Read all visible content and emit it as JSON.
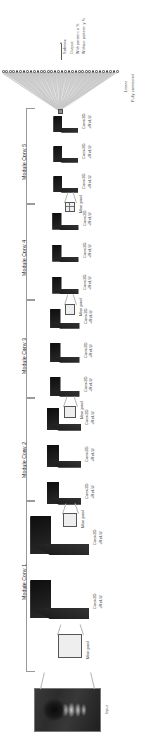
{
  "figure": {
    "type": "cnn-architecture-diagram",
    "orientation": "rotated-90-ccw",
    "input": {
      "label": "Input"
    },
    "output": {
      "softmax_label": "Softmax",
      "output_label": "Output:",
      "class_with": "With pattern: x %",
      "class_without": "Without pattern: y %"
    },
    "dense": {
      "linear_label": "Linear",
      "fully_connected_label": "Fully connected",
      "neuron_count": 34
    },
    "layer_labels": {
      "conv": "Conv2D",
      "relu": "+ReLU",
      "maxpool": "Max pool"
    },
    "modules": [
      {
        "name": "Module Conv 1",
        "conv_count": 2,
        "layers": [
          {
            "kind": "conv",
            "line1": "Conv2D",
            "line2": "+ReLU"
          },
          {
            "kind": "conv",
            "line1": "Conv2D",
            "line2": "+ReLU"
          },
          {
            "kind": "pool",
            "line1": "Max pool",
            "line2": ""
          }
        ]
      },
      {
        "name": "Module Conv 2",
        "conv_count": 3,
        "layers": [
          {
            "kind": "conv",
            "line1": "Conv2D",
            "line2": "+ReLU"
          },
          {
            "kind": "conv",
            "line1": "Conv2D",
            "line2": "+ReLU"
          },
          {
            "kind": "conv",
            "line1": "Conv2D",
            "line2": "+ReLU"
          },
          {
            "kind": "pool",
            "line1": "Max pool",
            "line2": ""
          }
        ]
      },
      {
        "name": "Module Conv 3",
        "conv_count": 3,
        "layers": [
          {
            "kind": "conv",
            "line1": "Conv2D",
            "line2": "+ReLU"
          },
          {
            "kind": "conv",
            "line1": "Conv2D",
            "line2": "+ReLU"
          },
          {
            "kind": "conv",
            "line1": "Conv2D",
            "line2": "+ReLU"
          },
          {
            "kind": "pool",
            "line1": "Max pool",
            "line2": ""
          }
        ]
      },
      {
        "name": "Module Conv 4",
        "conv_count": 3,
        "layers": [
          {
            "kind": "conv",
            "line1": "Conv2D",
            "line2": "+ReLU"
          },
          {
            "kind": "conv",
            "line1": "Conv2D",
            "line2": "+ReLU"
          },
          {
            "kind": "conv",
            "line1": "Conv2D",
            "line2": "+ReLU"
          },
          {
            "kind": "pool",
            "line1": "Max pool",
            "line2": ""
          }
        ]
      },
      {
        "name": "Module Conv 5",
        "conv_count": 3,
        "layers": [
          {
            "kind": "conv",
            "line1": "Conv2D",
            "line2": "+ReLU"
          },
          {
            "kind": "conv",
            "line1": "Conv2D",
            "line2": "+ReLU"
          },
          {
            "kind": "conv",
            "line1": "Conv2D",
            "line2": "+ReLU"
          },
          {
            "kind": "pool",
            "line1": "Max pool",
            "line2": ""
          }
        ]
      }
    ],
    "colors": {
      "grid_face": "#f2f2f2",
      "grid_line": "#6e6e6e",
      "extrusion": "#1d1d1d",
      "bracket": "#9a9a9a",
      "wire": "#c9c9c9",
      "text": "#3a3a3a"
    }
  }
}
